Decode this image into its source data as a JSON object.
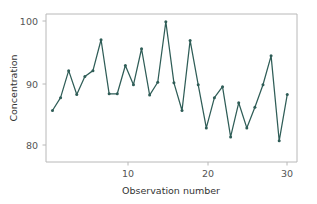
{
  "chart_data": {
    "type": "line",
    "title": "",
    "xlabel": "Observation number",
    "ylabel": "Concentration",
    "x": [
      1,
      2,
      3,
      4,
      5,
      6,
      7,
      8,
      9,
      10,
      11,
      12,
      13,
      14,
      15,
      16,
      17,
      18,
      19,
      20,
      21,
      22,
      23,
      24,
      25,
      26,
      27,
      28,
      29,
      30
    ],
    "values": [
      86.0,
      88.0,
      92.2,
      88.5,
      91.3,
      92.2,
      97.0,
      88.6,
      88.6,
      93.0,
      90.0,
      95.6,
      88.4,
      90.4,
      99.8,
      90.3,
      86.0,
      96.9,
      90.0,
      83.3,
      88.0,
      89.7,
      81.9,
      87.2,
      83.3,
      86.5,
      90.0,
      94.5,
      81.3,
      88.5
    ],
    "series": [
      {
        "name": "Concentration",
        "values": [
          86.0,
          88.0,
          92.2,
          88.5,
          91.3,
          92.2,
          97.0,
          88.6,
          88.6,
          93.0,
          90.0,
          95.6,
          88.4,
          90.4,
          99.8,
          90.3,
          86.0,
          96.9,
          90.0,
          83.3,
          88.0,
          89.7,
          81.9,
          87.2,
          83.3,
          86.5,
          90.0,
          94.5,
          81.3,
          88.5
        ]
      }
    ],
    "xlim": [
      0.2,
      31.2
    ],
    "ylim": [
      78.0,
      101.0
    ],
    "xticks": [
      10,
      20,
      30
    ],
    "xtick_labels": [
      "10",
      "20",
      "30"
    ],
    "yticks": [
      80,
      90,
      100
    ],
    "ytick_labels": [
      "80",
      "90",
      "100"
    ],
    "grid": false,
    "legend": false,
    "legend_position": "none",
    "marker": "circle",
    "line_color": "#2f5d57",
    "marker_color": "#2f5d57",
    "background_color": "#ffffff",
    "axis_color": "#b8b8b8",
    "tick_label_color": "#555555",
    "axis_title_color": "#333333"
  }
}
